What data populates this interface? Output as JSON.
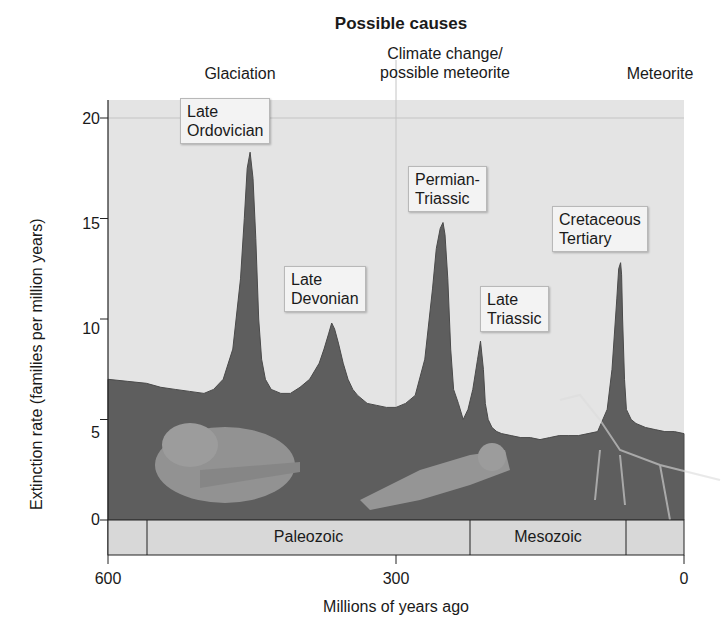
{
  "title": "Possible causes",
  "causes": [
    {
      "label": "Glaciation",
      "x_my": 470
    },
    {
      "label": "Climate change/\npossible meteorite",
      "x_my": 250
    },
    {
      "label": "Meteorite",
      "x_my": 65
    }
  ],
  "axes": {
    "ylabel": "Extinction rate (families per million years)",
    "xlabel": "Millions of years ago",
    "yticks": [
      "0",
      "5",
      "10",
      "15",
      "20"
    ],
    "xticks": [
      "600",
      "300",
      "0"
    ]
  },
  "events": [
    {
      "label": "Late\nOrdovician"
    },
    {
      "label": "Late\nDevonian"
    },
    {
      "label": "Permian-\nTriassic"
    },
    {
      "label": "Late\nTriassic"
    },
    {
      "label": "Cretaceous\nTertiary"
    }
  ],
  "eras": [
    {
      "label": "Paleozoic"
    },
    {
      "label": "Mesozoic"
    }
  ],
  "colors": {
    "area_fill": "#5f5f5f",
    "area_top": "#6d6d6d",
    "plot_bg": "#e2e2e2",
    "era_bar": "#d6d6d6"
  },
  "chart_data": {
    "type": "area",
    "title": "Possible causes",
    "xlabel": "Millions of years ago",
    "ylabel": "Extinction rate (families per million years)",
    "xlim": [
      600,
      0
    ],
    "ylim": [
      -1.5,
      21.5
    ],
    "xticks": [
      600,
      300,
      0
    ],
    "yticks": [
      0,
      5,
      10,
      15,
      20
    ],
    "grid": "light vertical line at 300 and horizontal line at 20",
    "x": [
      600,
      580,
      560,
      545,
      530,
      515,
      500,
      490,
      480,
      470,
      462,
      458,
      455,
      452,
      449,
      446,
      443,
      440,
      436,
      430,
      420,
      410,
      400,
      390,
      380,
      375,
      370,
      367,
      364,
      360,
      355,
      350,
      345,
      340,
      330,
      320,
      310,
      300,
      290,
      280,
      270,
      262,
      258,
      254,
      251,
      249,
      246,
      243,
      240,
      235,
      230,
      225,
      220,
      215,
      212,
      209,
      207,
      204,
      200,
      195,
      190,
      180,
      170,
      160,
      150,
      140,
      130,
      120,
      110,
      100,
      90,
      80,
      75,
      70,
      68,
      66,
      65,
      64,
      62,
      60,
      55,
      50,
      40,
      30,
      20,
      10,
      0
    ],
    "values": [
      7.0,
      6.9,
      6.8,
      6.6,
      6.5,
      6.4,
      6.3,
      6.5,
      7.0,
      8.5,
      12.0,
      15.0,
      17.5,
      18.3,
      17.0,
      14.0,
      10.0,
      8.0,
      7.0,
      6.5,
      6.3,
      6.3,
      6.6,
      7.0,
      7.8,
      8.5,
      9.3,
      9.8,
      9.5,
      8.8,
      7.8,
      7.0,
      6.5,
      6.2,
      5.8,
      5.7,
      5.6,
      5.6,
      5.8,
      6.2,
      8.0,
      11.5,
      13.5,
      14.5,
      14.8,
      14.2,
      12.0,
      8.5,
      6.5,
      5.8,
      5.0,
      5.5,
      6.5,
      8.0,
      8.9,
      7.5,
      5.8,
      5.0,
      4.6,
      4.4,
      4.3,
      4.2,
      4.1,
      4.1,
      4.0,
      4.1,
      4.2,
      4.2,
      4.2,
      4.3,
      4.4,
      5.5,
      7.5,
      11.0,
      12.5,
      12.8,
      12.2,
      10.0,
      7.0,
      5.5,
      5.0,
      4.8,
      4.6,
      4.5,
      4.4,
      4.4,
      4.3
    ],
    "annotations": [
      {
        "text": "Late Ordovician",
        "x": 450,
        "y": 18.3
      },
      {
        "text": "Late Devonian",
        "x": 365,
        "y": 9.8
      },
      {
        "text": "Permian-Triassic",
        "x": 251,
        "y": 14.8
      },
      {
        "text": "Late Triassic",
        "x": 210,
        "y": 8.9
      },
      {
        "text": "Cretaceous Tertiary",
        "x": 65,
        "y": 12.8
      }
    ],
    "causes": [
      {
        "text": "Glaciation",
        "x": 470
      },
      {
        "text": "Climate change/possible meteorite",
        "x": 250
      },
      {
        "text": "Meteorite",
        "x": 65
      }
    ],
    "eras": [
      {
        "name": "Paleozoic",
        "start": 542,
        "end": 251
      },
      {
        "name": "Mesozoic",
        "start": 251,
        "end": 65
      }
    ]
  }
}
